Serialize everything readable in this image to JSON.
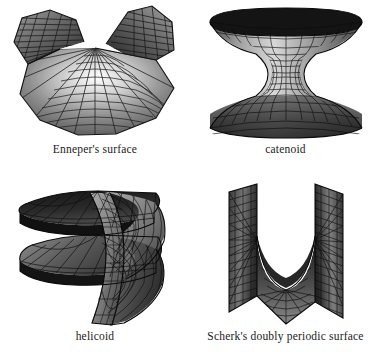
{
  "figure": {
    "background_color": "#ffffff",
    "ink_color": "#1a1a1a",
    "layout": "2x2 grid of grayscale 3D minimal-surface renderings, each labelled by a caption beneath it",
    "panels": [
      {
        "id": "enneper",
        "caption": "Enneper's surface",
        "icon_name": "enneper-surface-render",
        "description": "Saddle-shaped surface with two raised wings and a broad lower fan, drawn as a dense radial wireframe mesh",
        "mesh": {
          "radial_spokes": 16,
          "rings": 13,
          "style": "radial-fan"
        },
        "shading": {
          "light": "#e8e8e8",
          "mid": "#8e8e8e",
          "dark": "#2a2a2a"
        }
      },
      {
        "id": "catenoid",
        "caption": "catenoid",
        "icon_name": "catenoid-surface-render",
        "description": "Hourglass surface of revolution with dark flared rims at top and bottom and a lighter narrow waist",
        "mesh": {
          "meridians": 28,
          "parallels": 16,
          "style": "quad-grid"
        },
        "shading": {
          "light": "#d6d6d6",
          "mid": "#7a7a7a",
          "dark": "#1e1e1e"
        }
      },
      {
        "id": "helicoid",
        "caption": "helicoid",
        "icon_name": "helicoid-surface-render",
        "description": "Spiral ramp winding around a vertical axis through roughly two turns, with dark upper ramp faces",
        "mesh": {
          "turns": 2,
          "radial_lines": 14,
          "style": "ruled-spiral"
        },
        "shading": {
          "light": "#c8c8c8",
          "mid": "#6f6f6f",
          "dark": "#1c1c1c"
        }
      },
      {
        "id": "scherk",
        "caption": "Scherk's doubly periodic surface",
        "icon_name": "scherk-surface-render",
        "description": "Two tall vertical wings joined by a saddle, enclosing a U-shaped white gap at the top and a fanned tunnel below",
        "mesh": {
          "vertical_panels": 2,
          "fan_lines": 22,
          "style": "ruled-fan"
        },
        "shading": {
          "light": "#cfcfcf",
          "mid": "#6a6a6a",
          "dark": "#171717"
        }
      }
    ]
  }
}
